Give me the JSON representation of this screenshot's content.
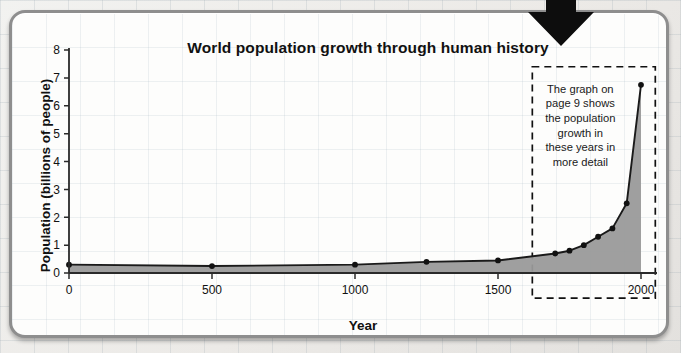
{
  "figure": {
    "frame_color": "#8e8e8e",
    "paper_color": "#fdfdfc",
    "arrow_icon": "down-arrow-icon"
  },
  "chart_data": {
    "type": "area",
    "title": "World population growth through human history",
    "xlabel": "Year",
    "ylabel": "Population (billions of people)",
    "xlim": [
      0,
      2050
    ],
    "ylim": [
      0,
      8
    ],
    "grid": false,
    "legend": "none",
    "series_name": "World population",
    "line_color": "#1a1a1a",
    "fill_color": "#9a9a9a",
    "marker_color": "#111111",
    "x_ticks": [
      0,
      500,
      1000,
      1500,
      2000
    ],
    "x_tick_labels": [
      "0",
      "500",
      "1000",
      "1500",
      "2000"
    ],
    "y_ticks": [
      0,
      1,
      2,
      3,
      4,
      5,
      6,
      7,
      8
    ],
    "y_tick_labels": [
      "0",
      "1",
      "2",
      "3",
      "4",
      "5",
      "6",
      "7",
      "8"
    ],
    "x": [
      0,
      500,
      1000,
      1250,
      1500,
      1700,
      1750,
      1800,
      1850,
      1900,
      1950,
      2000
    ],
    "values": [
      0.3,
      0.25,
      0.3,
      0.4,
      0.45,
      0.7,
      0.8,
      1.0,
      1.3,
      1.6,
      2.5,
      6.75
    ],
    "annotation": {
      "name": "detail-callout",
      "style": "dashed-box",
      "lines": [
        "The graph on",
        "page 9 shows",
        "the population",
        "growth in",
        "these years in",
        "more detail"
      ],
      "box_x_range": [
        1620,
        2050
      ],
      "box_y_range": [
        -0.9,
        7.4
      ]
    }
  }
}
